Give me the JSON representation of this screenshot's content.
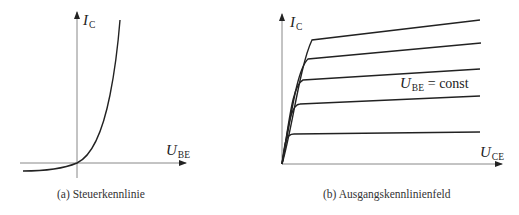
{
  "figure_a": {
    "y_axis_label": {
      "symbol": "I",
      "subscript": "C"
    },
    "x_axis_label": {
      "symbol": "U",
      "subscript": "BE"
    },
    "caption": "(a) Steuerkennlinie"
  },
  "figure_b": {
    "y_axis_label": {
      "symbol": "I",
      "subscript": "C"
    },
    "x_axis_label": {
      "symbol": "U",
      "subscript": "CE"
    },
    "annotation": {
      "symbol": "U",
      "subscript": "BE",
      "text": "= const"
    },
    "caption": "(b) Ausgangskennlinienfeld",
    "curve_count": 5
  },
  "colors": {
    "axis": "#888888",
    "curve": "#222222",
    "text": "#222222"
  }
}
